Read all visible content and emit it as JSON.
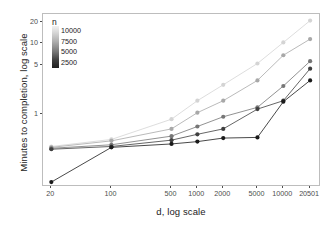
{
  "chart_data": {
    "type": "line",
    "title": "",
    "xlabel": "d, log scale",
    "ylabel": "Minutes to completion, log scale",
    "xscale": "log",
    "yscale": "log",
    "grid": false,
    "legend_position": "top-left-inside",
    "legend_title": "n",
    "x": [
      20,
      100,
      500,
      1000,
      2000,
      5000,
      10000,
      20501
    ],
    "xtick_labels": [
      "20",
      "100",
      "500",
      "1000",
      "2000",
      "5000",
      "10000",
      "20501"
    ],
    "ytick_labels": [
      "20",
      "10",
      "5",
      "1"
    ],
    "ytick_values": [
      20,
      10,
      5,
      1
    ],
    "ylim": [
      0.1,
      26
    ],
    "xlim": [
      16,
      26000
    ],
    "legend_entries": [
      "10000",
      "7500",
      "5000",
      "2500"
    ],
    "series": [
      {
        "name": "10000",
        "color": "#d4d4d4",
        "values": [
          0.35,
          0.44,
          0.85,
          1.55,
          2.6,
          5.2,
          10.3,
          21.0
        ]
      },
      {
        "name": "7500",
        "color": "#a8a8a8",
        "values": [
          0.34,
          0.42,
          0.62,
          1.05,
          1.55,
          3.0,
          6.8,
          11.5
        ]
      },
      {
        "name": "5000",
        "color": "#767676",
        "values": [
          0.33,
          0.37,
          0.49,
          0.67,
          0.92,
          1.25,
          2.5,
          5.6
        ]
      },
      {
        "name": "2500",
        "color": "#3f3f3f",
        "values": [
          0.32,
          0.35,
          0.43,
          0.52,
          0.62,
          1.18,
          1.55,
          4.4
        ]
      },
      {
        "name": "2500b",
        "color": "#1a1a1a",
        "values": [
          0.11,
          0.34,
          0.38,
          0.41,
          0.46,
          0.47,
          1.5,
          3.0
        ]
      }
    ]
  },
  "axes": {
    "x_title": "d, log scale",
    "y_title": "Minutes to completion, log scale"
  },
  "legend": {
    "title": "n",
    "labels": [
      "10000",
      "7500",
      "5000",
      "2500"
    ]
  }
}
